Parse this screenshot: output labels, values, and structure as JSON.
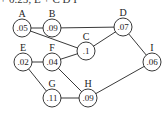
{
  "caption_fragment": "+ 0.25; E + C D I",
  "nodes": [
    {
      "id": "A",
      "value": ".05",
      "x": 22,
      "y": 28
    },
    {
      "id": "B",
      "value": ".09",
      "x": 52,
      "y": 28
    },
    {
      "id": "C",
      "value": ".1",
      "x": 86,
      "y": 51
    },
    {
      "id": "D",
      "value": ".07",
      "x": 123,
      "y": 27
    },
    {
      "id": "E",
      "value": ".02",
      "x": 23,
      "y": 62
    },
    {
      "id": "F",
      "value": ".04",
      "x": 52,
      "y": 62
    },
    {
      "id": "G",
      "value": ".11",
      "x": 52,
      "y": 98
    },
    {
      "id": "H",
      "value": ".09",
      "x": 88,
      "y": 98
    },
    {
      "id": "I",
      "value": ".06",
      "x": 152,
      "y": 62
    }
  ],
  "edges": [
    [
      "A",
      "B"
    ],
    [
      "A",
      "C"
    ],
    [
      "B",
      "D"
    ],
    [
      "C",
      "D"
    ],
    [
      "D",
      "I"
    ],
    [
      "E",
      "F"
    ],
    [
      "F",
      "C"
    ],
    [
      "E",
      "G"
    ],
    [
      "F",
      "H"
    ],
    [
      "G",
      "H"
    ],
    [
      "H",
      "I"
    ]
  ],
  "style": {
    "stroke": "#222222",
    "fill": "#ffffff"
  }
}
